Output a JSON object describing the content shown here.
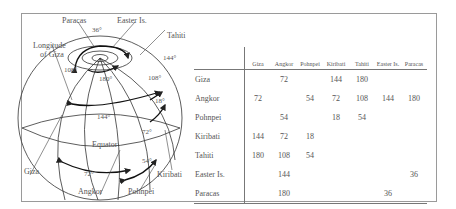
{
  "diagram": {
    "globe_labels": {
      "paracas": "Paracas",
      "easter_island": "Easter Is.",
      "tahiti": "Tahiti",
      "longitude_line1": "Longitude",
      "longitude_line2": "of Giza",
      "giza": "Giza",
      "angkor": "Angkor",
      "pohnpei": "Pohnpei",
      "kiribati": "Kiribati",
      "equator": "Equator"
    },
    "angles": {
      "a36": "36°",
      "a144_top": "144°",
      "a108_left": "108°",
      "a180": "180°",
      "a108_right": "108°",
      "a18": "18°",
      "a144_mid": "144°",
      "a72_mid": "72°",
      "a54": "54°",
      "a72_low": "72°"
    }
  },
  "table": {
    "columns": [
      "Giza",
      "Angkor",
      "Pohnpei",
      "Kiribati",
      "Tahiti",
      "Easter Is.",
      "Paracas"
    ],
    "rows": [
      {
        "label": "Giza",
        "cells": [
          "",
          "72",
          "",
          "144",
          "180",
          "",
          ""
        ]
      },
      {
        "label": "Angkor",
        "cells": [
          "72",
          "",
          "54",
          "72",
          "108",
          "144",
          "180"
        ]
      },
      {
        "label": "Pohnpei",
        "cells": [
          "",
          "54",
          "",
          "18",
          "54",
          "",
          ""
        ]
      },
      {
        "label": "Kiribati",
        "cells": [
          "144",
          "72",
          "18",
          "",
          "",
          "",
          ""
        ]
      },
      {
        "label": "Tahiti",
        "cells": [
          "180",
          "108",
          "54",
          "",
          "",
          "",
          ""
        ]
      },
      {
        "label": "Easter Is.",
        "cells": [
          "",
          "144",
          "",
          "",
          "",
          "",
          "36"
        ]
      },
      {
        "label": "Paracas",
        "cells": [
          "",
          "180",
          "",
          "",
          "",
          "36",
          ""
        ]
      }
    ]
  }
}
